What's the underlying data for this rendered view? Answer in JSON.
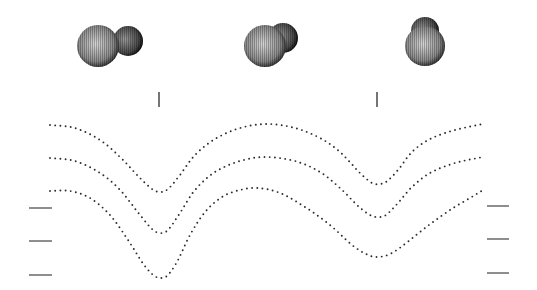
{
  "figure": {
    "background": "#ffffff",
    "ink_color": "#2a2a2a"
  },
  "stars": [
    {
      "name": "phase-1-binary",
      "primary": {
        "cx": 98,
        "cy": 46,
        "r": 21
      },
      "secondary": {
        "cx": 128,
        "cy": 41,
        "r": 15
      }
    },
    {
      "name": "phase-2-binary",
      "primary": {
        "cx": 265,
        "cy": 46,
        "r": 21
      },
      "secondary": {
        "cx": 283,
        "cy": 38,
        "r": 15
      }
    },
    {
      "name": "phase-3-binary",
      "primary": {
        "cx": 425,
        "cy": 46,
        "r": 20
      },
      "secondary": {
        "cx": 425,
        "cy": 31,
        "r": 14
      }
    }
  ],
  "markers": [
    {
      "name": "primary-eclipse-marker",
      "x": 159,
      "y1": 92,
      "y2": 107
    },
    {
      "name": "secondary-eclipse-marker",
      "x": 377,
      "y1": 92,
      "y2": 107
    }
  ],
  "ticks": {
    "left": [
      {
        "x1": 29,
        "x2": 52,
        "y": 208
      },
      {
        "x1": 29,
        "x2": 52,
        "y": 241
      },
      {
        "x1": 29,
        "x2": 52,
        "y": 275
      }
    ],
    "right": [
      {
        "x1": 487,
        "x2": 509,
        "y": 206
      },
      {
        "x1": 487,
        "x2": 509,
        "y": 239
      },
      {
        "x1": 487,
        "x2": 509,
        "y": 273
      }
    ]
  },
  "chart_data": {
    "type": "line",
    "style": "dotted",
    "title": "",
    "xlabel": "",
    "ylabel": "",
    "grid": false,
    "series": [
      {
        "name": "light-curve-1",
        "points": [
          [
            50,
            125
          ],
          [
            75,
            128
          ],
          [
            100,
            140
          ],
          [
            120,
            157
          ],
          [
            140,
            178
          ],
          [
            152,
            189
          ],
          [
            160,
            192
          ],
          [
            168,
            189
          ],
          [
            180,
            175
          ],
          [
            195,
            155
          ],
          [
            215,
            139
          ],
          [
            240,
            128
          ],
          [
            267,
            124
          ],
          [
            295,
            128
          ],
          [
            320,
            138
          ],
          [
            340,
            152
          ],
          [
            360,
            173
          ],
          [
            372,
            183
          ],
          [
            378,
            184
          ],
          [
            386,
            182
          ],
          [
            398,
            170
          ],
          [
            412,
            152
          ],
          [
            430,
            139
          ],
          [
            455,
            130
          ],
          [
            483,
            124
          ]
        ]
      },
      {
        "name": "light-curve-2",
        "points": [
          [
            50,
            158
          ],
          [
            75,
            161
          ],
          [
            100,
            173
          ],
          [
            120,
            190
          ],
          [
            140,
            215
          ],
          [
            152,
            229
          ],
          [
            160,
            233
          ],
          [
            168,
            230
          ],
          [
            180,
            213
          ],
          [
            195,
            190
          ],
          [
            215,
            172
          ],
          [
            240,
            161
          ],
          [
            265,
            157
          ],
          [
            295,
            161
          ],
          [
            320,
            172
          ],
          [
            340,
            188
          ],
          [
            358,
            206
          ],
          [
            370,
            215
          ],
          [
            378,
            217
          ],
          [
            386,
            215
          ],
          [
            398,
            203
          ],
          [
            412,
            187
          ],
          [
            430,
            173
          ],
          [
            455,
            163
          ],
          [
            483,
            157
          ]
        ]
      },
      {
        "name": "light-curve-3",
        "points": [
          [
            50,
            191
          ],
          [
            70,
            191
          ],
          [
            90,
            198
          ],
          [
            110,
            215
          ],
          [
            128,
            240
          ],
          [
            142,
            262
          ],
          [
            152,
            274
          ],
          [
            160,
            278
          ],
          [
            168,
            275
          ],
          [
            178,
            260
          ],
          [
            190,
            235
          ],
          [
            205,
            212
          ],
          [
            222,
            197
          ],
          [
            240,
            190
          ],
          [
            258,
            188
          ],
          [
            280,
            193
          ],
          [
            305,
            207
          ],
          [
            330,
            225
          ],
          [
            352,
            245
          ],
          [
            368,
            255
          ],
          [
            378,
            257
          ],
          [
            390,
            254
          ],
          [
            405,
            244
          ],
          [
            425,
            228
          ],
          [
            450,
            210
          ],
          [
            470,
            198
          ],
          [
            483,
            190
          ]
        ]
      }
    ]
  }
}
